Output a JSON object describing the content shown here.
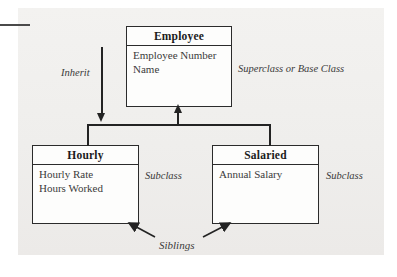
{
  "diagram": {
    "type": "uml-class-inheritance",
    "classes": [
      {
        "id": "employee",
        "name": "Employee",
        "role": "superclass",
        "attributes": [
          "Employee Number",
          "Name"
        ]
      },
      {
        "id": "hourly",
        "name": "Hourly",
        "role": "subclass",
        "attributes": [
          "Hourly Rate",
          "Hours Worked"
        ]
      },
      {
        "id": "salaried",
        "name": "Salaried",
        "role": "subclass",
        "attributes": [
          "Annual Salary"
        ]
      }
    ],
    "annotations": {
      "inherit": "Inherit",
      "superclass": "Superclass or Base Class",
      "subclass_left": "Subclass",
      "subclass_right": "Subclass",
      "siblings": "Siblings"
    },
    "colors": {
      "panel_background": "#f1f0ee",
      "page_background": "#ffffff",
      "box_fill": "#fdfdfc",
      "line": "#232323",
      "title_text": "#1b1b1b",
      "attribute_text": "#3b3b3b",
      "annotation_text": "#3a3a3a"
    }
  }
}
